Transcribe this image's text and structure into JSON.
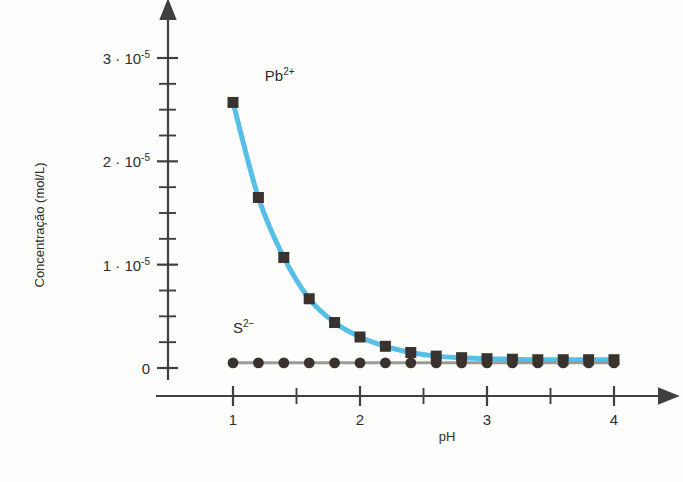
{
  "chart_data": {
    "type": "line",
    "title": "",
    "xlabel": "pH",
    "ylabel": "Concentração (mol/L)",
    "xlim": [
      0.6,
      4.25
    ],
    "ylim": [
      0,
      3.2e-05
    ],
    "grid": false,
    "legend": "inline-annotations",
    "x_ticks_major": [
      1,
      2,
      3,
      4
    ],
    "x_tick_labels": [
      "1",
      "2",
      "3",
      "4"
    ],
    "x_ticks_minor": [
      1.5,
      2.5,
      3.5
    ],
    "y_ticks_major": [
      0,
      1e-05,
      2e-05,
      3e-05
    ],
    "y_tick_labels": [
      "0",
      "1 · 10",
      "2 · 10",
      "3 · 10"
    ],
    "y_tick_exponent": "-5",
    "y_ticks_minor": [
      2.5e-06,
      5e-06,
      7.5e-06,
      1.25e-05,
      1.5e-05,
      1.75e-05,
      2.25e-05,
      2.5e-05,
      2.75e-05
    ],
    "x": [
      1.0,
      1.2,
      1.4,
      1.6,
      1.8,
      2.0,
      2.2,
      2.4,
      2.6,
      2.8,
      3.0,
      3.2,
      3.4,
      3.6,
      3.8,
      4.0
    ],
    "series": [
      {
        "name": "Pb2+",
        "label": "Pb",
        "label_sup": "2+",
        "marker": "square",
        "marker_color": "#3a322c",
        "line_color": "#55bfe8",
        "values": [
          2.57e-05,
          1.65e-05,
          1.07e-05,
          6.7e-06,
          4.4e-06,
          3e-06,
          2.1e-06,
          1.5e-06,
          1.15e-06,
          1e-06,
          9e-07,
          8.5e-07,
          8e-07,
          8e-07,
          8e-07,
          8e-07
        ],
        "label_x": 1.25,
        "label_y": 2.78e-05
      },
      {
        "name": "S2-",
        "label": "S",
        "label_sup": "2−",
        "marker": "circle",
        "marker_color": "#3a322c",
        "line_color": "#9a9a98",
        "values": [
          5e-07,
          5e-07,
          5e-07,
          5e-07,
          5e-07,
          5e-07,
          5e-07,
          5e-07,
          5e-07,
          5e-07,
          5e-07,
          5e-07,
          5e-07,
          5e-07,
          5e-07,
          5e-07
        ],
        "label_x": 1.0,
        "label_y": 3.4e-06
      }
    ],
    "colors": {
      "pb_line": "#55bfe8",
      "s_line": "#9a9a98",
      "marker": "#3a322c",
      "axis": "#404040",
      "text": "#2e2e2e",
      "background": "#fdfdfc"
    }
  }
}
